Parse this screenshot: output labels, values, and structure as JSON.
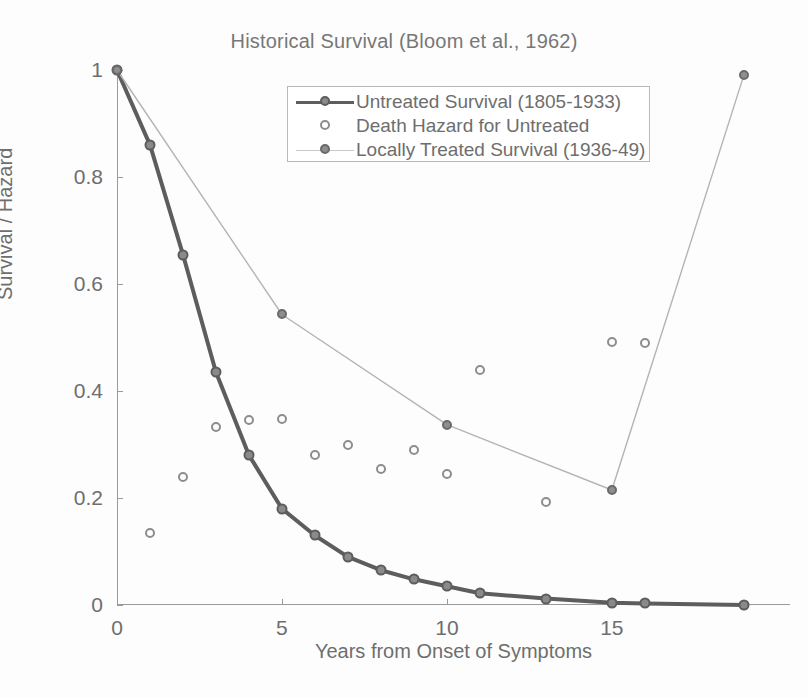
{
  "chart_data": {
    "type": "line",
    "title": "Historical Survival (Bloom et al., 1962)",
    "xlabel": "Years from Onset of Symptoms",
    "ylabel": "Survival / Hazard",
    "xlim": [
      0,
      20.4
    ],
    "ylim": [
      0,
      1.0
    ],
    "grid": false,
    "legend_position": "top-center-inside",
    "xticks": [
      0,
      5,
      10,
      15
    ],
    "xtick_labels": [
      "0",
      "5",
      "10",
      "15"
    ],
    "yticks": [
      0,
      0.2,
      0.4,
      0.6,
      0.8,
      1
    ],
    "ytick_labels": [
      "0",
      "0.2",
      "0.4",
      "0.6",
      "0.8",
      "1"
    ],
    "series": [
      {
        "name": "Untreated Survival (1805-1933)",
        "style": "line-marker",
        "color": "#5d5d5d",
        "x": [
          0,
          1,
          2,
          3,
          4,
          5,
          6,
          7,
          8,
          9,
          10,
          11,
          13,
          15,
          16,
          19
        ],
        "values": [
          1.0,
          0.86,
          0.655,
          0.435,
          0.28,
          0.18,
          0.13,
          0.09,
          0.065,
          0.048,
          0.035,
          0.022,
          0.012,
          0.004,
          0.003,
          0.0
        ]
      },
      {
        "name": "Death Hazard for Untreated",
        "style": "scatter",
        "color": "#8d8d8d",
        "x": [
          1,
          2,
          3,
          4,
          5,
          6,
          7,
          8,
          9,
          10,
          11,
          13,
          15,
          16
        ],
        "values": [
          0.135,
          0.24,
          0.333,
          0.345,
          0.347,
          0.28,
          0.3,
          0.255,
          0.29,
          0.245,
          0.44,
          0.193,
          0.492,
          0.49
        ]
      },
      {
        "name": "Locally Treated Survival (1936-49)",
        "style": "dotted-line-marker",
        "color": "#b4b4b4",
        "x": [
          0,
          5,
          10,
          15,
          19
        ],
        "values": [
          1.0,
          0.543,
          0.337,
          0.215,
          0.99
        ]
      }
    ]
  },
  "legend": {
    "items": [
      {
        "label": "Untreated Survival (1805-1933)",
        "key": "line-with-marker"
      },
      {
        "label": "Death Hazard for Untreated",
        "key": "open-circle-marker"
      },
      {
        "label": "Locally Treated Survival (1936-49)",
        "key": "dotted-line-with-marker"
      }
    ]
  },
  "colors": {
    "untreated": "#5d5d5d",
    "hazard": "#8d8d8d",
    "treated": "#b4b4b4",
    "axis": "#9a9a9a",
    "text": "#6e6e6e"
  }
}
